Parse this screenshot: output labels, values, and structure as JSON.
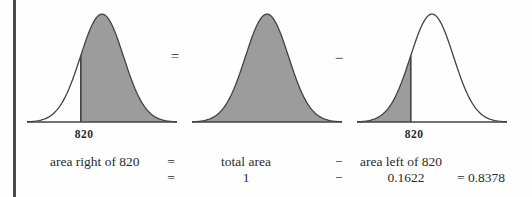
{
  "page": {
    "background": "#fefefe",
    "rule_color": "#4a4a4a",
    "text_color": "#2b2b2b"
  },
  "chart_data": {
    "type": "area",
    "title": "",
    "fill_color": "#9c9c9c",
    "stroke_color": "#434343",
    "geometry": {
      "width": 156,
      "height": 116,
      "centerX": 78,
      "sigma": 21.5,
      "baseY": 112,
      "peakY": 4
    },
    "charts": [
      {
        "name": "area right of 820",
        "shade": "right-of-cut",
        "cut_z": -0.985,
        "cut_label": "820",
        "shaded_area": 0.8378
      },
      {
        "name": "total area",
        "shade": "full",
        "shaded_area": 1
      },
      {
        "name": "area left of 820",
        "shade": "left-of-cut",
        "cut_z": -0.985,
        "cut_label": "820",
        "shaded_area": 0.1622
      }
    ],
    "operators": [
      "=",
      "−"
    ]
  },
  "equation": {
    "row1": {
      "lhs": "area right of 820",
      "eq": "=",
      "mid": "total area",
      "minus": "−",
      "rhs": "area left of 820"
    },
    "row2": {
      "eq": "=",
      "mid": "1",
      "minus": "−",
      "rhs": "0.1622",
      "result": "= 0.8378"
    }
  }
}
